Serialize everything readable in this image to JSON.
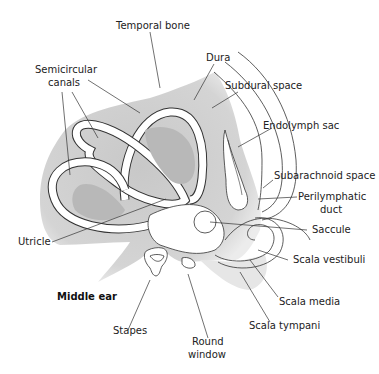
{
  "diagram": {
    "labels": {
      "temporal_bone": "Temporal bone",
      "semicircular_canals_1": "Semicircular",
      "semicircular_canals_2": "canals",
      "dura": "Dura",
      "subdural_space": "Subdural space",
      "endolymph_sac": "Endolymph sac",
      "subarachnoid_space": "Subarachnoid space",
      "perilymphatic_duct_1": "Perilymphatic",
      "perilymphatic_duct_2": "duct",
      "saccule": "Saccule",
      "scala_vestibuli": "Scala vestibuli",
      "utricle": "Utricle",
      "middle_ear": "Middle ear",
      "scala_media": "Scala media",
      "stapes": "Stapes",
      "scala_tympani": "Scala tympani",
      "round_window_1": "Round",
      "round_window_2": "window"
    },
    "colors": {
      "bone_fill": "#cfcfcf",
      "cavity_fill": "#b5b5b5",
      "outline": "#333333",
      "leader": "#333333",
      "text": "#222222"
    }
  }
}
